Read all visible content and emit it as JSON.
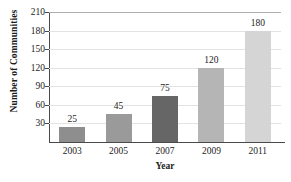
{
  "chart_data": {
    "type": "bar",
    "title": "",
    "title_note": "title is cropped off the top edge of the screenshot",
    "categories": [
      "2003",
      "2005",
      "2007",
      "2009",
      "2011"
    ],
    "values": [
      25,
      45,
      75,
      120,
      180
    ],
    "xlabel": "Year",
    "ylabel": "Number of Communities",
    "ylim": [
      0,
      210
    ],
    "yticks": [
      30,
      60,
      90,
      120,
      150,
      180,
      210
    ],
    "ytick_labels": [
      "30",
      "60",
      "90",
      "120",
      "150",
      "180",
      "210"
    ],
    "data_labels": [
      "25",
      "45",
      "75",
      "120",
      "180"
    ],
    "grid": true,
    "grid_axis": "y",
    "legend": false,
    "bar_colors": [
      "#8e8e8e",
      "#9a9a9a",
      "#666666",
      "#b5b5b5",
      "#d5d5d5"
    ],
    "axis_color": "#4a4a4a",
    "grid_color": "#e3e3e3",
    "text_color": "#1c1c1c"
  }
}
